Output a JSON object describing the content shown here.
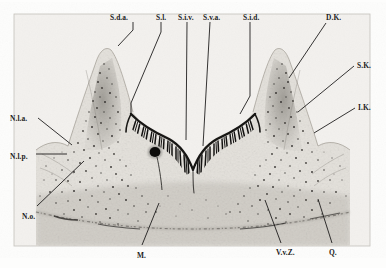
{
  "figure": {
    "kind": "histological-section-micrograph",
    "frame": {
      "x": 14,
      "y": 14,
      "width": 356,
      "height": 232,
      "border_color": "#b9b9b9"
    },
    "background_color": "#f2f0ec",
    "tissue_color": "#8d8a84",
    "ink_color": "#1b1b1b"
  },
  "labels": [
    {
      "id": "s-d-a",
      "text": "S.d.a.",
      "x": 110,
      "y": 14,
      "anchor": "start"
    },
    {
      "id": "s-l",
      "text": "S.l.",
      "x": 156,
      "y": 14,
      "anchor": "start"
    },
    {
      "id": "s-i-v",
      "text": "S.i.v.",
      "x": 178,
      "y": 14,
      "anchor": "start"
    },
    {
      "id": "s-v-a",
      "text": "S.v.a.",
      "x": 203,
      "y": 14,
      "anchor": "start"
    },
    {
      "id": "s-i-d",
      "text": "S.i.d.",
      "x": 243,
      "y": 14,
      "anchor": "start"
    },
    {
      "id": "d-k",
      "text": "D.K.",
      "x": 326,
      "y": 14,
      "anchor": "start"
    },
    {
      "id": "s-k",
      "text": "S.K.",
      "x": 357,
      "y": 62,
      "anchor": "start"
    },
    {
      "id": "i-k",
      "text": "I.K.",
      "x": 358,
      "y": 104,
      "anchor": "start"
    },
    {
      "id": "n-l-a",
      "text": "N.l.a.",
      "x": 10,
      "y": 115,
      "anchor": "start"
    },
    {
      "id": "n-l-p",
      "text": "N.l.p.",
      "x": 10,
      "y": 153,
      "anchor": "start"
    },
    {
      "id": "n-o",
      "text": "N.o.",
      "x": 22,
      "y": 213,
      "anchor": "start"
    },
    {
      "id": "m",
      "text": "M.",
      "x": 137,
      "y": 252,
      "anchor": "start"
    },
    {
      "id": "v-v-z",
      "text": "V.v.Z.",
      "x": 276,
      "y": 249,
      "anchor": "start"
    },
    {
      "id": "q",
      "text": "Q.",
      "x": 329,
      "y": 249,
      "anchor": "start"
    }
  ],
  "leaders": [
    {
      "id": "leader-s-d-a",
      "for": "S.d.a.",
      "points": "133,22 133,30 118,46"
    },
    {
      "id": "leader-s-l",
      "for": "S.l.",
      "points": "161,22 161,32 131,103 131,113"
    },
    {
      "id": "leader-s-i-v",
      "for": "S.i.v.",
      "points": "187,22 187,140"
    },
    {
      "id": "leader-s-v-a",
      "for": "S.v.a.",
      "points": "210,22 203,145"
    },
    {
      "id": "leader-s-i-d",
      "for": "S.i.d.",
      "points": "250,22 250,96 240,114"
    },
    {
      "id": "leader-d-k",
      "for": "D.K.",
      "points": "326,23 290,77"
    },
    {
      "id": "leader-s-k",
      "for": "S.K.",
      "points": "355,66 299,111"
    },
    {
      "id": "leader-i-k",
      "for": "I.K.",
      "points": "356,108 316,132"
    },
    {
      "id": "leader-n-l-a",
      "for": "N.l.a.",
      "points": "38,118 72,144"
    },
    {
      "id": "leader-n-l-p",
      "for": "N.l.p.",
      "points": "38,154 66,154"
    },
    {
      "id": "leader-n-o",
      "for": "N.o.",
      "points": "37,206 83,162"
    },
    {
      "id": "leader-m",
      "for": "M.",
      "points": "142,245 158,204"
    },
    {
      "id": "leader-v-v-z",
      "for": "V.v.Z.",
      "points": "281,243 265,201"
    },
    {
      "id": "leader-q",
      "for": "Q.",
      "points": "332,243 318,200"
    }
  ],
  "structure_notes": {
    "left_lobe": "pointed papilla rising left of midline with dense pigmented stratum",
    "right_lobe": "pointed papilla rising right of midline with dense pigmented stratum",
    "midline_cleft": "deep V-shaped interlobar groove at centre",
    "black_nodule": "small dark rounded body at base of left lobe groove",
    "basal_border": "broad shallow arc forming the lower tissue boundary"
  }
}
